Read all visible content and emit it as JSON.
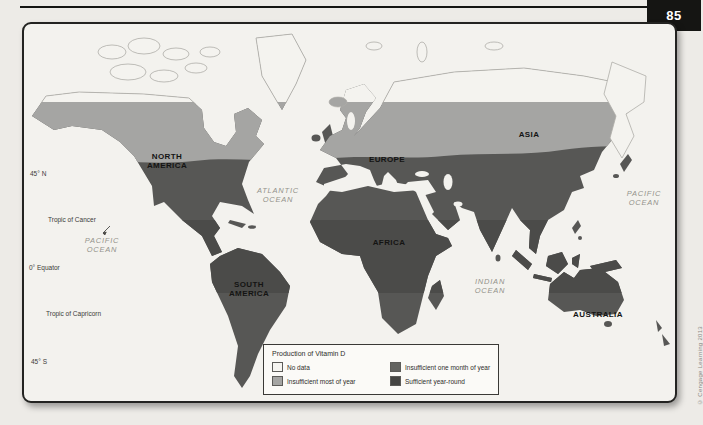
{
  "page": {
    "number": "85",
    "copyright": "© Cengage Learning 2013"
  },
  "map": {
    "continents": {
      "north_america": "NORTH AMERICA",
      "south_america": "SOUTH AMERICA",
      "europe": "EUROPE",
      "asia": "ASIA",
      "africa": "AFRICA",
      "australia": "AUSTRALIA"
    },
    "oceans": {
      "pacific_west": "PACIFIC OCEAN",
      "atlantic": "ATLANTIC OCEAN",
      "indian": "INDIAN OCEAN",
      "pacific_east": "PACIFIC OCEAN"
    },
    "latitudes": {
      "lat_45n": "45° N",
      "tropic_cancer": "Tropic of Cancer",
      "equator": "0° Equator",
      "tropic_capricorn": "Tropic of Capricorn",
      "lat_45s": "45° S"
    }
  },
  "legend": {
    "title": "Production of Vitamin D",
    "items": [
      {
        "label": "No data",
        "color": "#f6f5f1"
      },
      {
        "label": "Insufficient most of year",
        "color": "#a5a5a3"
      },
      {
        "label": "Insufficient one month of year",
        "color": "#636360"
      },
      {
        "label": "Sufficient year-round",
        "color": "#454543"
      }
    ]
  },
  "zone_colors": {
    "ocean": "#f3f2ee",
    "no_data": "#f4f3ef",
    "insufficient_most_of_year": "#a5a5a3",
    "insufficient_one_month": "#575755",
    "sufficient_year_round": "#4b4b49"
  }
}
